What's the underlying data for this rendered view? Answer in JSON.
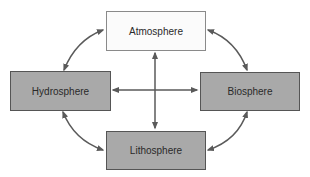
{
  "diagram": {
    "type": "earth-systems-interaction",
    "nodes": [
      {
        "id": "atmosphere",
        "label": "Atmosphere",
        "fill": "#fbfbfb"
      },
      {
        "id": "hydrosphere",
        "label": "Hydrosphere",
        "fill": "#a9a9a9"
      },
      {
        "id": "biosphere",
        "label": "Biosphere",
        "fill": "#a9a9a9"
      },
      {
        "id": "lithosphere",
        "label": "Lithosphere",
        "fill": "#a9a9a9"
      }
    ],
    "edges": [
      {
        "from": "atmosphere",
        "to": "hydrosphere",
        "direction": "both",
        "style": "curved"
      },
      {
        "from": "atmosphere",
        "to": "biosphere",
        "direction": "both",
        "style": "curved"
      },
      {
        "from": "hydrosphere",
        "to": "lithosphere",
        "direction": "both",
        "style": "curved"
      },
      {
        "from": "biosphere",
        "to": "lithosphere",
        "direction": "both",
        "style": "curved"
      },
      {
        "from": "atmosphere",
        "to": "lithosphere",
        "direction": "both",
        "style": "straight"
      },
      {
        "from": "hydrosphere",
        "to": "biosphere",
        "direction": "both",
        "style": "straight"
      }
    ],
    "colors": {
      "arrow": "#5a5a5a",
      "dark_box": "#a9a9a9",
      "light_box": "#fbfbfb",
      "border": "#555555",
      "text": "#2a2a2a"
    }
  }
}
